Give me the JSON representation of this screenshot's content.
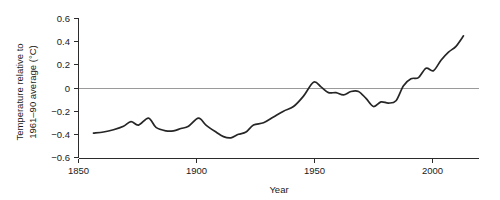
{
  "chart_data": {
    "type": "line",
    "title": "",
    "xlabel": "Year",
    "ylabel_line1": "Temperature relative to",
    "ylabel_line2": "1961–90 average (°C)",
    "xlim": [
      1850,
      2010
    ],
    "ylim": [
      -0.6,
      0.6
    ],
    "grid": false,
    "legend": "none",
    "zero_reference_line": 0,
    "xticks": [
      1850,
      1900,
      1950,
      2000
    ],
    "xtick_labels": [
      "1850",
      "1900",
      "1950",
      "2000"
    ],
    "yticks": [
      0.6,
      0.4,
      0.2,
      0,
      -0.2,
      -0.4,
      -0.6
    ],
    "ytick_labels": [
      "0.6",
      "0.4",
      "0.2",
      "0",
      "−0.2",
      "−0.4",
      "−0.6"
    ],
    "series": [
      {
        "name": "Global mean temperature anomaly",
        "color": "#262626",
        "x": [
          1856,
          1860,
          1864,
          1868,
          1871,
          1874,
          1878,
          1881,
          1885,
          1888,
          1891,
          1894,
          1898,
          1901,
          1905,
          1908,
          1911,
          1914,
          1917,
          1920,
          1924,
          1928,
          1932,
          1936,
          1940,
          1944,
          1947,
          1950,
          1953,
          1956,
          1959,
          1962,
          1965,
          1968,
          1971,
          1974,
          1977,
          1980,
          1983,
          1986,
          1989,
          1992,
          1995,
          1998,
          2001,
          2004
        ],
        "y": [
          -0.39,
          -0.38,
          -0.36,
          -0.33,
          -0.29,
          -0.32,
          -0.26,
          -0.34,
          -0.37,
          -0.37,
          -0.35,
          -0.33,
          -0.26,
          -0.32,
          -0.38,
          -0.42,
          -0.43,
          -0.4,
          -0.38,
          -0.32,
          -0.3,
          -0.25,
          -0.2,
          -0.16,
          -0.07,
          0.05,
          0.01,
          -0.04,
          -0.04,
          -0.06,
          -0.03,
          -0.03,
          -0.09,
          -0.16,
          -0.12,
          -0.13,
          -0.11,
          0.02,
          0.08,
          0.09,
          0.17,
          0.15,
          0.24,
          0.31,
          0.36,
          0.45
        ]
      }
    ]
  },
  "axes": {
    "x_axis_name": "year-axis",
    "y_axis_name": "temperature-anomaly-axis"
  }
}
